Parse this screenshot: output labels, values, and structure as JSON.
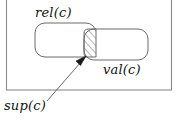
{
  "figure": {
    "type": "set-diagram",
    "labels": {
      "outer_set": "",
      "left_set": "rel(c)",
      "right_set": "val(c)",
      "annotation": "sup(c)"
    },
    "colors": {
      "stroke": "#4d4d4d",
      "outer_stroke": "#808080",
      "text": "#111111",
      "hatch": "#777777",
      "background": "#ffffff"
    },
    "regions": [
      {
        "name": "outer-container",
        "shape": "rectangle",
        "x": 6,
        "y": -4,
        "width": 166,
        "height": 94
      },
      {
        "name": "rel-set",
        "shape": "rounded-rectangle",
        "x": 35,
        "y": 23,
        "width": 61,
        "height": 34,
        "radius": 10
      },
      {
        "name": "val-set",
        "shape": "rounded-rectangle",
        "x": 84,
        "y": 29,
        "width": 64,
        "height": 31,
        "radius": 10
      },
      {
        "name": "intersection",
        "shape": "lens",
        "x": 84,
        "y": 29,
        "width": 12,
        "height": 28,
        "fill": "diagonal-hatch"
      }
    ],
    "arrow": {
      "name": "sup-pointer",
      "from_x": 47,
      "from_y": 101,
      "to_x": 86,
      "to_y": 56
    }
  }
}
